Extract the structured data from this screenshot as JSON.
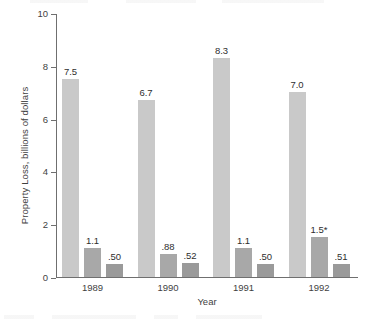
{
  "chart_data": {
    "type": "bar",
    "title": "",
    "xlabel": "Year",
    "ylabel": "Property Loss, billions of dollars",
    "categories": [
      "1989",
      "1990",
      "1991",
      "1992"
    ],
    "ylim": [
      0,
      10
    ],
    "yticks": [
      0,
      2,
      4,
      6,
      8,
      10
    ],
    "ytick_labels": [
      "0",
      "2",
      "4",
      "6",
      "8",
      "10"
    ],
    "grid": false,
    "legend": "none",
    "series": [
      {
        "name": "series-1",
        "color": "#c9c9c9",
        "values": [
          7.5,
          6.7,
          8.3,
          7.0
        ],
        "labels": [
          "7.5",
          "6.7",
          "8.3",
          "7.0"
        ]
      },
      {
        "name": "series-2",
        "color": "#a8a8a8",
        "values": [
          1.1,
          0.88,
          1.1,
          1.5
        ],
        "labels": [
          "1.1",
          ".88",
          "1.1",
          "1.5*"
        ]
      },
      {
        "name": "series-3",
        "color": "#9a9a9a",
        "values": [
          0.5,
          0.52,
          0.5,
          0.51
        ],
        "labels": [
          ".50",
          ".52",
          ".50",
          ".51"
        ]
      }
    ]
  },
  "colors": {
    "axis": "#6f6f6f",
    "text": "#3f3f3f",
    "background": "#ffffff"
  }
}
